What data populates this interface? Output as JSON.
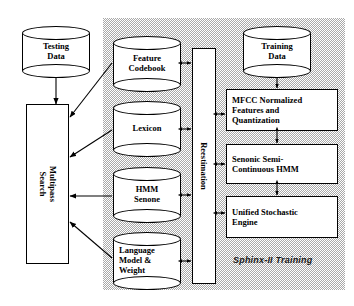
{
  "diagram": {
    "title_caption": "Sphinx-II Training",
    "panel": {
      "name": "training-panel"
    },
    "testing": {
      "data_store": "Testing\nData",
      "search": "Multipass\nSearch"
    },
    "knowledge_sources": [
      {
        "id": "feature-codebook",
        "label": "Feature\nCodebook"
      },
      {
        "id": "lexicon",
        "label": "Lexicon"
      },
      {
        "id": "hmm-senone",
        "label": "HMM\nSenone"
      },
      {
        "id": "language-model-weight",
        "label": "Language\nModel &\nWeight"
      }
    ],
    "reestimation": {
      "label": "Reestimation"
    },
    "training": {
      "data_store": "Training\nData",
      "stages": [
        {
          "id": "mfcc",
          "label": "MFCC Normalized\nFeatures and\nQuantization"
        },
        {
          "id": "senonic-hmm",
          "label": "Senonic Semi-\nContinuous HMM"
        },
        {
          "id": "unified-stochastic-engine",
          "label": "Unified Stochastic\nEngine"
        }
      ]
    },
    "colors": {
      "panel_gray": "#a9a9a9",
      "line": "#000000",
      "box_fill": "#ffffff",
      "page_bg": "#ffffff"
    }
  }
}
